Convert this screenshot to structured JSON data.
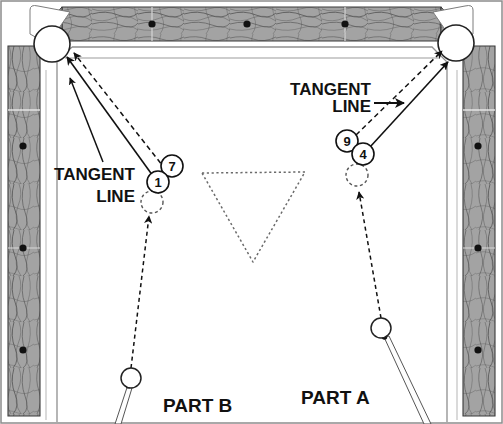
{
  "diagram": {
    "canvas": {
      "width": 503,
      "height": 424
    },
    "colors": {
      "rail_wood": "#9a9a9a",
      "rail_wood_light": "#b7b7b7",
      "grain_stroke": "#3d3d3d",
      "cloth": "#ffffff",
      "ink": "#111111",
      "ghost_stroke": "#555555",
      "diamond_spot": "#111111",
      "pocket_fill": "#ffffff"
    }
  },
  "labels": {
    "tangent_left": {
      "line1": "TANGENT",
      "line2": "LINE"
    },
    "tangent_right": {
      "line1": "TANGENT",
      "line2": "LINE"
    },
    "part_b": "PART B",
    "part_a": "PART A"
  },
  "balls": [
    {
      "id": "ball-7",
      "number": "7",
      "cx": 172,
      "cy": 166,
      "r": 11
    },
    {
      "id": "ball-1",
      "number": "1",
      "cx": 158,
      "cy": 182,
      "r": 11
    },
    {
      "id": "ball-9",
      "number": "9",
      "cx": 347,
      "cy": 141,
      "r": 11
    },
    {
      "id": "ball-4",
      "number": "4",
      "cx": 363,
      "cy": 154,
      "r": 11
    }
  ],
  "ghost_balls": [
    {
      "id": "ghost-ball-b",
      "cx": 152,
      "cy": 202,
      "r": 11
    },
    {
      "id": "ghost-ball-a",
      "cx": 357,
      "cy": 175,
      "r": 11
    }
  ],
  "cue_balls": [
    {
      "id": "cue-ball-b",
      "cx": 131,
      "cy": 378,
      "r": 10
    },
    {
      "id": "cue-ball-a",
      "cx": 381,
      "cy": 328,
      "r": 10
    }
  ],
  "pockets": [
    {
      "id": "pocket-top-left",
      "cx": 52,
      "cy": 44,
      "r": 18
    },
    {
      "id": "pocket-top-right",
      "cx": 456,
      "cy": 43,
      "r": 18
    }
  ],
  "rack_triangle": {
    "id": "rack-outline",
    "points": "202,173 305,172 253,262"
  },
  "diamond_spots": {
    "top_rail_y": 24,
    "top_rail_x": [
      152,
      247,
      345
    ],
    "left_rail_x": 23,
    "left_rail_y": [
      146,
      248,
      350
    ],
    "right_rail_x": 478,
    "right_rail_y": [
      146,
      248,
      350
    ]
  },
  "shot_lines": {
    "part_b_cue_path": "131,368 148,214",
    "part_b_object_solid": "155,177 66,56",
    "part_b_object_dashed": "166,171 72,52",
    "part_a_cue_path": "381,318 359,190",
    "part_a_object_solid": "368,146 447,60",
    "part_a_object_dashed": "355,136 441,52",
    "left_label_pointer": "100,163 70,78"
  },
  "cue_sticks": [
    {
      "id": "cue-stick-b",
      "tip_x": 125,
      "tip_y": 388,
      "butt_x": 112,
      "butt_y": 424
    },
    {
      "id": "cue-stick-a",
      "tip_x": 386,
      "tip_y": 338,
      "butt_x": 428,
      "butt_y": 424
    }
  ]
}
